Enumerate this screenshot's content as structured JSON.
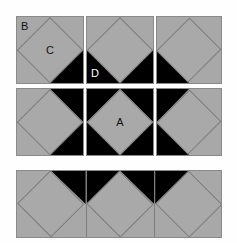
{
  "figure": {
    "background_color": "#fefefe",
    "gray_color": "#a8a8a8",
    "diamond_color": "#a9a9a9",
    "black_color": "#000000",
    "outline_color": "#8a8a8a"
  },
  "labels": {
    "a": "A",
    "b": "B",
    "c": "C",
    "d": "D"
  },
  "rows": [
    {
      "name": "top-row",
      "tiles": [
        {
          "name": "tile-r1c1",
          "corners": [
            "br"
          ],
          "labels": []
        },
        {
          "name": "tile-r1c2",
          "corners": [
            "bl",
            "br"
          ],
          "labels": []
        },
        {
          "name": "tile-r1c3",
          "corners": [
            "bl"
          ],
          "labels": []
        }
      ]
    },
    {
      "name": "middle-row",
      "tiles": [
        {
          "name": "tile-r2c1",
          "corners": [
            "tr",
            "br"
          ],
          "labels": []
        },
        {
          "name": "tile-r2c2",
          "corners": [
            "tl",
            "tr",
            "bl",
            "br"
          ],
          "labels": []
        },
        {
          "name": "tile-r2c3",
          "corners": [
            "tl",
            "bl"
          ],
          "labels": []
        }
      ]
    },
    {
      "name": "bottom-strip",
      "tiles": [
        {
          "name": "tile-r3c1",
          "corners": [
            "tr"
          ],
          "labels": []
        },
        {
          "name": "tile-r3c2",
          "corners": [
            "tl",
            "tr"
          ],
          "labels": []
        },
        {
          "name": "tile-r3c3",
          "corners": [
            "tl"
          ],
          "labels": []
        }
      ]
    }
  ]
}
